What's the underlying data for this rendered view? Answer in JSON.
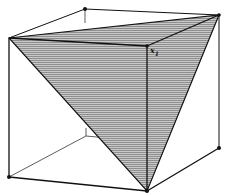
{
  "figure": {
    "colors": {
      "stroke": "#111111",
      "shade": "#9a9a9a",
      "hatch": "#d8d8d8",
      "background": "#ffffff"
    },
    "vertices": {
      "back_top_left": [
        85,
        9
      ],
      "back_top_right": [
        219,
        15
      ],
      "front_top_left": [
        9,
        38
      ],
      "front_top_right": [
        147,
        46
      ],
      "front_bottom_left": [
        9,
        177
      ],
      "front_bottom_right": [
        147,
        191
      ],
      "back_bottom_right": [
        219,
        148
      ],
      "back_bottom_left": [
        86,
        136
      ]
    },
    "label": {
      "text": "x",
      "subscript": "1",
      "position": [
        150,
        47
      ]
    }
  }
}
